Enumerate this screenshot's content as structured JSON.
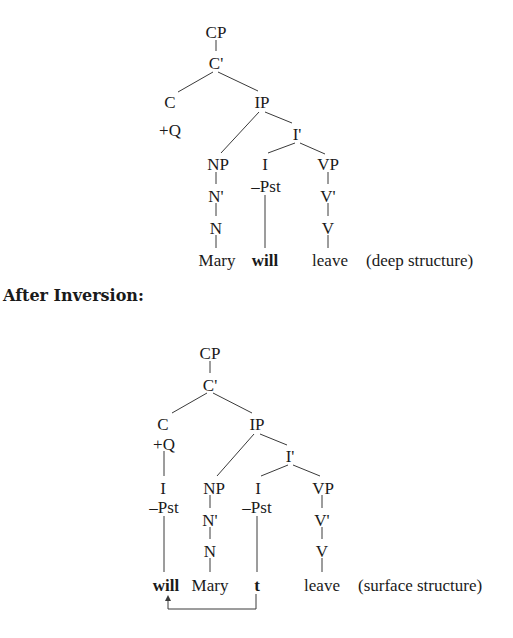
{
  "deep_tree": {
    "nodes": {
      "cp": "CP",
      "cbar": "C'",
      "c": "C",
      "c_feature": "+Q",
      "ip": "IP",
      "ibar": "I'",
      "np": "NP",
      "nbar": "N'",
      "n": "N",
      "i": "I",
      "i_feature": "–Pst",
      "vp": "VP",
      "vbar": "V'",
      "v": "V"
    },
    "words": {
      "subject": "Mary",
      "aux": "will",
      "verb": "leave"
    },
    "annotation": "(deep structure)"
  },
  "section_heading": "After Inversion:",
  "surface_tree": {
    "nodes": {
      "cp": "CP",
      "cbar": "C'",
      "c": "C",
      "c_feature": "+Q",
      "moved_i": "I",
      "moved_i_feature": "–Pst",
      "ip": "IP",
      "ibar": "I'",
      "np": "NP",
      "nbar": "N'",
      "n": "N",
      "i": "I",
      "i_feature": "–Pst",
      "vp": "VP",
      "vbar": "V'",
      "v": "V"
    },
    "words": {
      "aux": "will",
      "subject": "Mary",
      "trace": "t",
      "verb": "leave"
    },
    "annotation": "(surface structure)",
    "movement_arrow": "arrow from t to will"
  }
}
